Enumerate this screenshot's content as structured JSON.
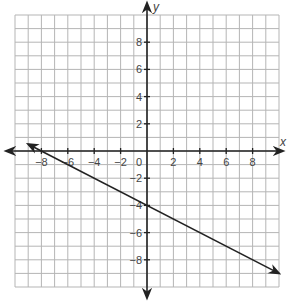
{
  "chart_data": {
    "type": "line",
    "title": "",
    "xlabel": "x",
    "ylabel": "y",
    "xlim": [
      -10,
      10
    ],
    "ylim": [
      -10,
      10
    ],
    "grid": true,
    "grid_step": 1,
    "x_ticks": [
      -8,
      -6,
      -4,
      -2,
      2,
      4,
      6,
      8
    ],
    "y_ticks": [
      8,
      6,
      4,
      2,
      -2,
      -4,
      -6,
      -8
    ],
    "origin_label": "0",
    "series": [
      {
        "name": "line",
        "equation": "y = -0.5x - 4",
        "slope": -0.5,
        "y_intercept": -4,
        "x_intercept": -8,
        "points": [
          [
            -9,
            0.5
          ],
          [
            -8,
            0
          ],
          [
            0,
            -4
          ],
          [
            10,
            -9
          ]
        ],
        "arrows": "both"
      }
    ]
  },
  "colors": {
    "grid": "#b5b5b5",
    "axis": "#222222",
    "line": "#222222",
    "text": "#444444"
  }
}
